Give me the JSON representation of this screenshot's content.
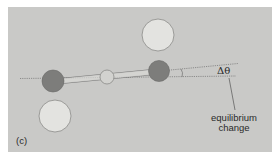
{
  "figure": {
    "panel_label": "(c)",
    "angle_label": "Δθ",
    "annotation": {
      "line1": "equilibrium",
      "line2": "change"
    },
    "colors": {
      "panel_bg": "#c9c9c7",
      "large_sphere_fill": "#e3e3e0",
      "small_sphere_fill": "#7d7d7b",
      "center_fiber_fill": "#d2d2cf",
      "outline": "#8a8a88",
      "dotted_line": "#707070",
      "text": "#2a2a2a"
    }
  }
}
